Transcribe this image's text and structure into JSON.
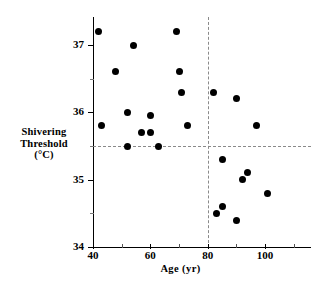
{
  "chart_data": {
    "type": "scatter",
    "title": "",
    "xlabel": "Age (yr)",
    "ylabel_lines": [
      "Shivering",
      "Threshold",
      "(°C)"
    ],
    "ylabel": "Shivering Threshold (°C)",
    "xlim": [
      40,
      116
    ],
    "ylim": [
      34,
      37.45
    ],
    "x_ticks_major": [
      40,
      60,
      80,
      100
    ],
    "x_ticks_major_labels": [
      "40",
      "60",
      "80",
      "100"
    ],
    "x_ticks_minor": [
      50,
      70,
      90,
      110
    ],
    "y_ticks_major": [
      34,
      35,
      36,
      37
    ],
    "y_ticks_major_labels": [
      "34",
      "35",
      "36",
      "37"
    ],
    "y_ticks_minor": [
      34.5,
      35.5,
      36.5
    ],
    "grid": false,
    "legend": null,
    "marker": "filled-circle",
    "marker_color": "#000000",
    "marker_size_px": 7,
    "reference_lines": [
      {
        "orientation": "horizontal",
        "value": 35.5,
        "style": "dashed",
        "color": "#8a8a8a"
      },
      {
        "orientation": "vertical",
        "value": 80,
        "style": "dashed",
        "color": "#8a8a8a"
      }
    ],
    "points": [
      {
        "x": 42,
        "y": 37.2
      },
      {
        "x": 43,
        "y": 35.8
      },
      {
        "x": 48,
        "y": 36.6
      },
      {
        "x": 52,
        "y": 36.0
      },
      {
        "x": 52,
        "y": 35.5
      },
      {
        "x": 54,
        "y": 37.0
      },
      {
        "x": 57,
        "y": 35.7
      },
      {
        "x": 60,
        "y": 35.95
      },
      {
        "x": 60,
        "y": 35.7
      },
      {
        "x": 63,
        "y": 35.5
      },
      {
        "x": 69,
        "y": 37.2
      },
      {
        "x": 70,
        "y": 36.6
      },
      {
        "x": 71,
        "y": 36.3
      },
      {
        "x": 73,
        "y": 35.8
      },
      {
        "x": 82,
        "y": 36.3
      },
      {
        "x": 83,
        "y": 34.5
      },
      {
        "x": 85,
        "y": 35.3
      },
      {
        "x": 85,
        "y": 34.6
      },
      {
        "x": 90,
        "y": 36.2
      },
      {
        "x": 90,
        "y": 34.4
      },
      {
        "x": 92,
        "y": 35.0
      },
      {
        "x": 94,
        "y": 35.1
      },
      {
        "x": 97,
        "y": 35.8
      },
      {
        "x": 101,
        "y": 34.8
      }
    ]
  }
}
